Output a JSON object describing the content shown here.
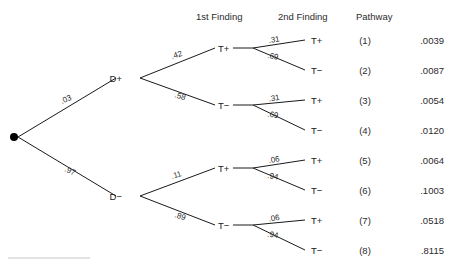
{
  "headers": [
    {
      "label": "1st Finding",
      "x": 196,
      "y": 20
    },
    {
      "label": "2nd Finding",
      "x": 278,
      "y": 20
    },
    {
      "label": "Pathway",
      "x": 356,
      "y": 20
    }
  ],
  "root": {
    "x": 14,
    "y": 137,
    "r": 4
  },
  "level1": [
    {
      "label": "D+",
      "prob": ".03",
      "node_x": 128,
      "node_y": 78,
      "label_x": 122,
      "label_y": 82,
      "prob_x": 62,
      "prob_y": 104,
      "prob_rot": -24
    },
    {
      "label": "D−",
      "prob": ".97",
      "node_x": 128,
      "node_y": 196,
      "label_x": 122,
      "label_y": 200,
      "prob_x": 64,
      "prob_y": 171,
      "prob_rot": 24
    }
  ],
  "level2": [
    {
      "label": "T+",
      "prob": ".42",
      "parent": "D+",
      "node_x": 225,
      "node_y": 48,
      "label_x": 218,
      "label_y": 52,
      "prob_x": 172,
      "prob_y": 59,
      "prob_rot": -17
    },
    {
      "label": "T−",
      "prob": ".58",
      "parent": "D+",
      "node_x": 225,
      "node_y": 105,
      "label_x": 218,
      "label_y": 109,
      "prob_x": 174,
      "prob_y": 97,
      "prob_rot": 17
    },
    {
      "label": "T+",
      "prob": ".11",
      "parent": "D−",
      "node_x": 225,
      "node_y": 168,
      "label_x": 218,
      "label_y": 172,
      "prob_x": 172,
      "prob_y": 179,
      "prob_rot": -17
    },
    {
      "label": "T−",
      "prob": ".89",
      "parent": "D−",
      "node_x": 225,
      "node_y": 225,
      "label_x": 218,
      "label_y": 229,
      "prob_x": 174,
      "prob_y": 217,
      "prob_rot": 17
    }
  ],
  "fans": [
    {
      "vertex_x": 253,
      "vertex_y": 48,
      "top_y": 40,
      "bottom_y": 70,
      "end_x": 305,
      "p_top": ".31",
      "p_bottom": ".69"
    },
    {
      "vertex_x": 253,
      "vertex_y": 105,
      "top_y": 100,
      "bottom_y": 130,
      "end_x": 305,
      "p_top": ".31",
      "p_bottom": ".69"
    },
    {
      "vertex_x": 253,
      "vertex_y": 168,
      "top_y": 160,
      "bottom_y": 190,
      "end_x": 305,
      "p_top": ".06",
      "p_bottom": ".94"
    },
    {
      "vertex_x": 253,
      "vertex_y": 225,
      "top_y": 220,
      "bottom_y": 250,
      "end_x": 305,
      "p_top": ".06",
      "p_bottom": ".94"
    }
  ],
  "leaves": [
    {
      "label": "T+",
      "pathway": "(1)",
      "value": ".0039",
      "y": 40
    },
    {
      "label": "T−",
      "pathway": "(2)",
      "value": ".0087",
      "y": 70
    },
    {
      "label": "T+",
      "pathway": "(3)",
      "value": ".0054",
      "y": 100
    },
    {
      "label": "T−",
      "pathway": "(4)",
      "value": ".0120",
      "y": 130
    },
    {
      "label": "T+",
      "pathway": "(5)",
      "value": ".0064",
      "y": 160
    },
    {
      "label": "T−",
      "pathway": "(6)",
      "value": ".1003",
      "y": 190
    },
    {
      "label": "T+",
      "pathway": "(7)",
      "value": ".0518",
      "y": 220
    },
    {
      "label": "T−",
      "pathway": "(8)",
      "value": ".8115",
      "y": 250
    }
  ],
  "columns": {
    "leaf_label_x": 311,
    "pathway_x": 365,
    "value_x": 444
  },
  "footer_rule": {
    "x1": 8,
    "x2": 90,
    "y": 258
  },
  "chart_data": {
    "type": "tree",
    "title": "",
    "column_headers": [
      "1st Finding",
      "2nd Finding",
      "Pathway"
    ],
    "root_label": "",
    "branches": {
      "disease": [
        {
          "label": "D+",
          "p": 0.03
        },
        {
          "label": "D−",
          "p": 0.97
        }
      ],
      "first_finding_given_Dplus": [
        {
          "label": "T+",
          "p": 0.42
        },
        {
          "label": "T−",
          "p": 0.58
        }
      ],
      "first_finding_given_Dminus": [
        {
          "label": "T+",
          "p": 0.11
        },
        {
          "label": "T−",
          "p": 0.89
        }
      ],
      "second_finding_given_Dplus": [
        {
          "label": "T+",
          "p": 0.31
        },
        {
          "label": "T−",
          "p": 0.69
        }
      ],
      "second_finding_given_Dminus": [
        {
          "label": "T+",
          "p": 0.06
        },
        {
          "label": "T−",
          "p": 0.94
        }
      ]
    },
    "pathways": [
      {
        "id": "(1)",
        "path": [
          "D+",
          "T+",
          "T+"
        ],
        "probability": 0.0039
      },
      {
        "id": "(2)",
        "path": [
          "D+",
          "T+",
          "T−"
        ],
        "probability": 0.0087
      },
      {
        "id": "(3)",
        "path": [
          "D+",
          "T−",
          "T+"
        ],
        "probability": 0.0054
      },
      {
        "id": "(4)",
        "path": [
          "D+",
          "T−",
          "T−"
        ],
        "probability": 0.012
      },
      {
        "id": "(5)",
        "path": [
          "D−",
          "T+",
          "T+"
        ],
        "probability": 0.0064
      },
      {
        "id": "(6)",
        "path": [
          "D−",
          "T+",
          "T−"
        ],
        "probability": 0.1003
      },
      {
        "id": "(7)",
        "path": [
          "D−",
          "T−",
          "T+"
        ],
        "probability": 0.0518
      },
      {
        "id": "(8)",
        "path": [
          "D−",
          "T−",
          "T−"
        ],
        "probability": 0.8115
      }
    ]
  }
}
